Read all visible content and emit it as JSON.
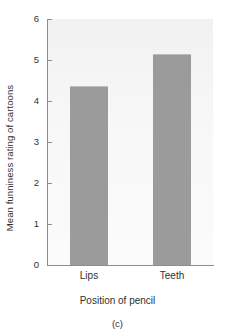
{
  "chart_data": {
    "type": "bar",
    "title": "",
    "subtitle": "",
    "categories": [
      "Lips",
      "Teeth"
    ],
    "values": [
      4.37,
      5.15
    ],
    "xlabel": "Position of pencil",
    "ylabel": "Mean funniness rating of cartoons",
    "ylim": [
      0,
      6
    ],
    "yticks": [
      0,
      1,
      2,
      3,
      4,
      5,
      6
    ],
    "ytick_labels": [
      "0",
      "1",
      "2",
      "3",
      "4",
      "5",
      "6"
    ],
    "grid": false,
    "legend": null,
    "caption": "(c)",
    "bar_color": "#9b9b9b",
    "plot_background": "#f4f4f4",
    "axis_color": "#8d8d8d",
    "text_color": "#2f2f2f"
  },
  "figure": {
    "caption_label": "(c)"
  }
}
